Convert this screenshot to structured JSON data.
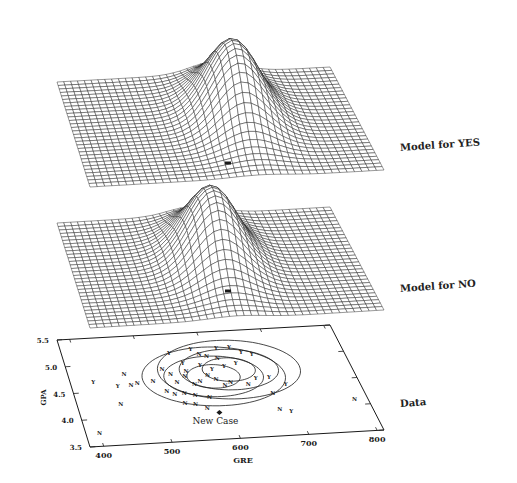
{
  "chart_data": [
    {
      "type": "surface",
      "title": "Model for YES",
      "description": "3D wireframe Gaussian density surface, single peak toward back-right-of-center",
      "grid": {
        "nx": 40,
        "ny": 30
      },
      "frame": {
        "back_left": [
          57,
          82
        ],
        "back_right": [
          330,
          67
        ],
        "front_right": [
          384,
          170
        ],
        "front_left": [
          90,
          187
        ]
      },
      "peak": {
        "u": 0.58,
        "v": 0.42,
        "height_px": 75,
        "sigma_u": 0.09,
        "sigma_v": 0.22
      },
      "new_case_marker": [
        228,
        163
      ]
    },
    {
      "type": "surface",
      "title": "Model for NO",
      "description": "3D wireframe Gaussian density surface, single peak slightly left of YES model",
      "grid": {
        "nx": 40,
        "ny": 30
      },
      "frame": {
        "back_left": [
          57,
          223
        ],
        "back_right": [
          330,
          207
        ],
        "front_right": [
          384,
          310
        ],
        "front_left": [
          90,
          328
        ]
      },
      "peak": {
        "u": 0.5,
        "v": 0.45,
        "height_px": 73,
        "sigma_u": 0.09,
        "sigma_v": 0.22
      },
      "new_case_marker": [
        228,
        291
      ]
    },
    {
      "type": "scatter",
      "title": "Data",
      "xlabel": "GRE",
      "ylabel": "GPA",
      "xlim": [
        380,
        810
      ],
      "ylim": [
        3.5,
        5.5
      ],
      "xticks": [
        "400",
        "500",
        "600",
        "700",
        "800"
      ],
      "yticks": [
        "3.5",
        "4.0",
        "4.5",
        "5.0",
        "5.5"
      ],
      "frame": {
        "back_left": [
          57,
          340
        ],
        "back_right": [
          330,
          325
        ],
        "front_right": [
          384,
          430
        ],
        "front_left": [
          90,
          447
        ]
      },
      "annotation": "New Case",
      "new_case": {
        "x": 585,
        "y": 4.0
      },
      "series": [
        {
          "name": "Y",
          "points": [
            [
              415,
              4.7
            ],
            [
              450,
              4.6
            ],
            [
              545,
              5.15
            ],
            [
              580,
              5.2
            ],
            [
              620,
              5.2
            ],
            [
              640,
              5.2
            ],
            [
              655,
              5.1
            ],
            [
              670,
              5.05
            ],
            [
              600,
              4.8
            ],
            [
              620,
              4.85
            ],
            [
              640,
              4.9
            ],
            [
              660,
              4.6
            ],
            [
              680,
              4.6
            ],
            [
              700,
              4.45
            ],
            [
              690,
              3.95
            ],
            [
              585,
              4.9
            ],
            [
              560,
              4.95
            ]
          ]
        },
        {
          "name": "N",
          "points": [
            [
              400,
              3.75
            ],
            [
              445,
              4.25
            ],
            [
              465,
              4.8
            ],
            [
              470,
              4.6
            ],
            [
              480,
              4.62
            ],
            [
              505,
              4.65
            ],
            [
              525,
              4.85
            ],
            [
              535,
              4.75
            ],
            [
              540,
              4.6
            ],
            [
              555,
              4.7
            ],
            [
              560,
              4.8
            ],
            [
              565,
              4.55
            ],
            [
              575,
              4.6
            ],
            [
              590,
              4.7
            ],
            [
              600,
              4.62
            ],
            [
              610,
              4.5
            ],
            [
              620,
              4.55
            ],
            [
              520,
              4.45
            ],
            [
              530,
              4.38
            ],
            [
              545,
              4.4
            ],
            [
              560,
              4.35
            ],
            [
              580,
              4.3
            ],
            [
              540,
              4.2
            ],
            [
              555,
              4.18
            ],
            [
              570,
              4.1
            ],
            [
              675,
              4.3
            ],
            [
              675,
              4.0
            ],
            [
              790,
              4.1
            ],
            [
              615,
              5.0
            ],
            [
              600,
              5.05
            ],
            [
              590,
              5.1
            ],
            [
              645,
              4.5
            ]
          ]
        }
      ],
      "ellipses": [
        {
          "cx": 598,
          "cy": 4.67,
          "rx": 40,
          "ry": 0.22
        },
        {
          "cx": 598,
          "cy": 4.67,
          "rx": 75,
          "ry": 0.38
        },
        {
          "cx": 598,
          "cy": 4.67,
          "rx": 108,
          "ry": 0.55
        },
        {
          "cx": 625,
          "cy": 4.78,
          "rx": 40,
          "ry": 0.22
        },
        {
          "cx": 625,
          "cy": 4.78,
          "rx": 75,
          "ry": 0.38
        },
        {
          "cx": 625,
          "cy": 4.78,
          "rx": 108,
          "ry": 0.55
        }
      ]
    }
  ],
  "labels": {
    "yes": "Model for YES",
    "no": "Model for NO",
    "data": "Data",
    "new_case": "New Case",
    "xlabel": "GRE",
    "ylabel": "GPA"
  },
  "colors": {
    "ink": "#1a1a1a",
    "background": "#ffffff"
  }
}
